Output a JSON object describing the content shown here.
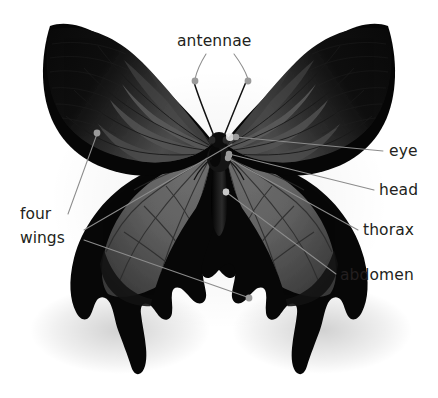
{
  "figure": {
    "background_color": "#ffffff",
    "label_color": "#231f20",
    "leader_color": "#8c8c8c",
    "wing_dark_color": "#0b0b0b",
    "wing_mid_color": "#4a4a4a",
    "wing_light_color": "#6e6e6e",
    "body_color": "#111111"
  },
  "labels": {
    "antennae": "antennae",
    "eye": "eye",
    "head": "head",
    "thorax": "thorax",
    "abdomen": "abdomen",
    "four": "four",
    "wings": "wings"
  },
  "callouts": [
    {
      "name": "antennae",
      "text": "antennae",
      "text_x": 177,
      "text_y": 46,
      "anchor": "start"
    },
    {
      "name": "eye",
      "text": "eye",
      "text_x": 389,
      "text_y": 156,
      "anchor": "start"
    },
    {
      "name": "head",
      "text": "head",
      "text_x": 379,
      "text_y": 195,
      "anchor": "start"
    },
    {
      "name": "thorax",
      "text": "thorax",
      "text_x": 363,
      "text_y": 235,
      "anchor": "start"
    },
    {
      "name": "abdomen",
      "text": "abdomen",
      "text_x": 340,
      "text_y": 280,
      "anchor": "start"
    },
    {
      "name": "four-wings-line1",
      "text": "four",
      "text_x": 20,
      "text_y": 219,
      "anchor": "start"
    },
    {
      "name": "four-wings-line2",
      "text": "wings",
      "text_x": 20,
      "text_y": 243,
      "anchor": "start"
    }
  ]
}
